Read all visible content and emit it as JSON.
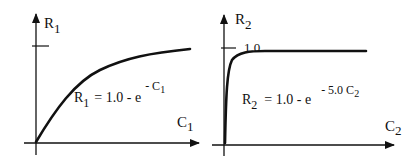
{
  "diagrams": [
    {
      "y_axis_label": {
        "main": "R",
        "sub": "1"
      },
      "x_axis_label": {
        "main": "C",
        "sub": "1"
      },
      "tick_label": "",
      "equation": {
        "lhs_main": "R",
        "lhs_sub": "1",
        "rhs": "= 1.0 - e",
        "exp_prefix": "- C",
        "exp_sub": "1"
      }
    },
    {
      "y_axis_label": {
        "main": "R",
        "sub": "2"
      },
      "x_axis_label": {
        "main": "C",
        "sub": "2"
      },
      "tick_label": "1.0",
      "equation": {
        "lhs_main": "R",
        "lhs_sub": "2",
        "rhs": "= 1.0 - e",
        "exp_prefix": "- 5.0 C",
        "exp_sub": "2"
      }
    }
  ],
  "colors": {
    "ink": "#111111",
    "background": "#ffffff"
  }
}
